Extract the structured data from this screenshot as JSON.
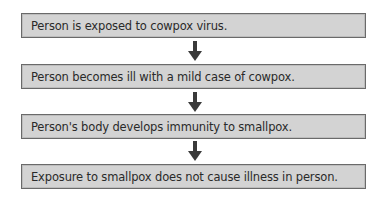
{
  "diagram": {
    "type": "flowchart",
    "direction": "top-to-bottom",
    "colors": {
      "box_fill": "#d3d3d3",
      "box_border": "#6a6a6a",
      "arrow": "#3a3a3a",
      "text": "#2a2a2a"
    },
    "steps": [
      {
        "label": "Person is exposed to cowpox virus."
      },
      {
        "label": "Person becomes ill with a mild case of cowpox."
      },
      {
        "label": "Person's body develops immunity to smallpox."
      },
      {
        "label": "Exposure to smallpox does not cause illness in person."
      }
    ],
    "arrows": [
      {
        "from": 0,
        "to": 1,
        "icon": "down-arrow-icon"
      },
      {
        "from": 1,
        "to": 2,
        "icon": "down-arrow-icon"
      },
      {
        "from": 2,
        "to": 3,
        "icon": "down-arrow-icon"
      }
    ]
  }
}
